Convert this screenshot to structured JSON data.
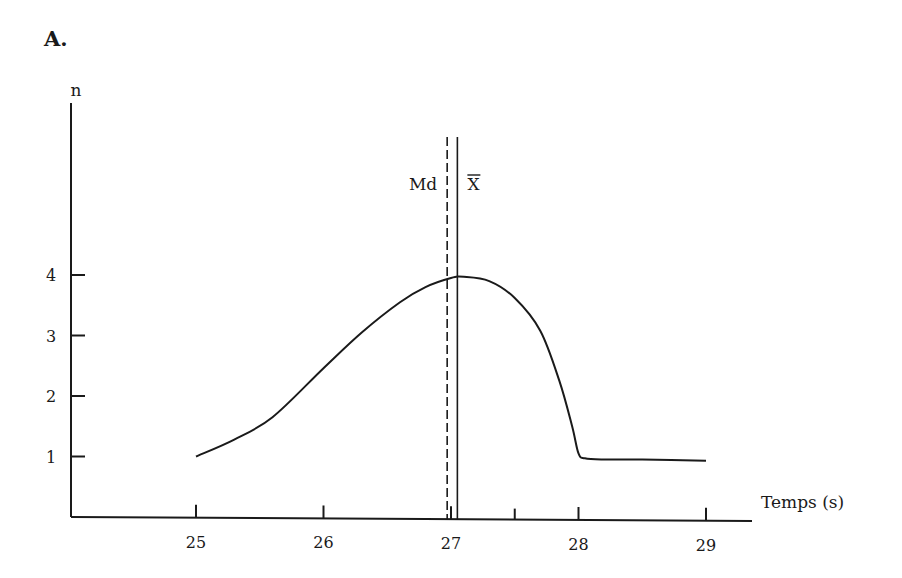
{
  "figure": {
    "panel_label": "A."
  },
  "chart_data": {
    "type": "line",
    "title": "",
    "panel_label": "A.",
    "xlabel": "Temps (s)",
    "ylabel": "n",
    "xlim": [
      24.0,
      29.4
    ],
    "ylim": [
      0,
      6.8
    ],
    "grid": false,
    "legend": null,
    "x_ticks": [
      25,
      26,
      27,
      27.5,
      28,
      29
    ],
    "x_tick_labels": [
      "25",
      "26",
      "27",
      "",
      "28",
      "29"
    ],
    "y_ticks": [
      1,
      2,
      3,
      4
    ],
    "y_tick_labels": [
      "1",
      "2",
      "3",
      "4"
    ],
    "series": [
      {
        "name": "frequency curve",
        "style": "solid",
        "x": [
          25.0,
          25.3,
          25.6,
          26.0,
          26.3,
          26.6,
          26.8,
          27.0,
          27.1,
          27.3,
          27.5,
          27.7,
          27.85,
          27.95,
          28.0,
          28.05,
          28.2,
          28.5,
          29.0
        ],
        "y": [
          1.0,
          1.28,
          1.65,
          2.46,
          3.05,
          3.55,
          3.8,
          3.95,
          3.97,
          3.9,
          3.62,
          3.08,
          2.25,
          1.5,
          1.05,
          0.97,
          0.95,
          0.95,
          0.93
        ]
      }
    ],
    "annotations": [
      {
        "type": "vline",
        "label": "Md",
        "x": 26.97,
        "style": "dashed",
        "meaning": "median"
      },
      {
        "type": "vline",
        "label": "X̄",
        "x": 27.05,
        "style": "solid",
        "meaning": "mean"
      }
    ]
  }
}
